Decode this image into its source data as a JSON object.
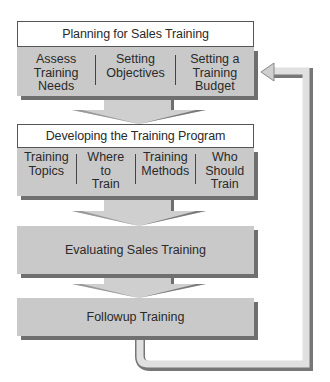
{
  "diagram": {
    "stages": [
      {
        "title": "Planning for Sales Training",
        "items": [
          "Assess\nTraining\nNeeds",
          "Setting\nObjectives",
          "Setting a\nTraining\nBudget"
        ]
      },
      {
        "title": "Developing the Training Program",
        "items": [
          "Training\nTopics",
          "Where\nto\nTrain",
          "Training\nMethods",
          "Who\nShould\nTrain"
        ]
      },
      {
        "title": "Evaluating Sales Training"
      },
      {
        "title": "Followup Training"
      }
    ],
    "colors": {
      "box_fill": "#c9c9c9",
      "shadow": "#6f6f6f",
      "arrow_fill": "#cfcfcf",
      "pipe_fill": "#e0e0e0",
      "pipe_edge": "#777777"
    }
  }
}
